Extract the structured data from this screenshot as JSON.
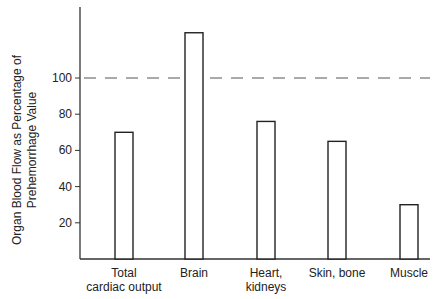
{
  "chart_data": {
    "type": "bar",
    "title": "",
    "xlabel": "",
    "ylabel": "Organ Blood Flow as Percentage of Prehemorrhage Value",
    "ylabel_lines": [
      "Organ Blood Flow as Percentage of",
      "Prehemorrhage Value"
    ],
    "categories": [
      "Total cardiac output",
      "Brain",
      "Heart, kidneys",
      "Skin, bone",
      "Muscle"
    ],
    "category_lines": [
      [
        "Total",
        "cardiac output"
      ],
      [
        "Brain"
      ],
      [
        "Heart,",
        "kidneys"
      ],
      [
        "Skin, bone"
      ],
      [
        "Muscle"
      ]
    ],
    "values": [
      70,
      125,
      76,
      65,
      30
    ],
    "yticks": [
      20,
      40,
      60,
      80,
      100
    ],
    "ylim": [
      0,
      130
    ],
    "reference_line": {
      "value": 100,
      "style": "dashed"
    },
    "grid": false,
    "legend": null
  }
}
